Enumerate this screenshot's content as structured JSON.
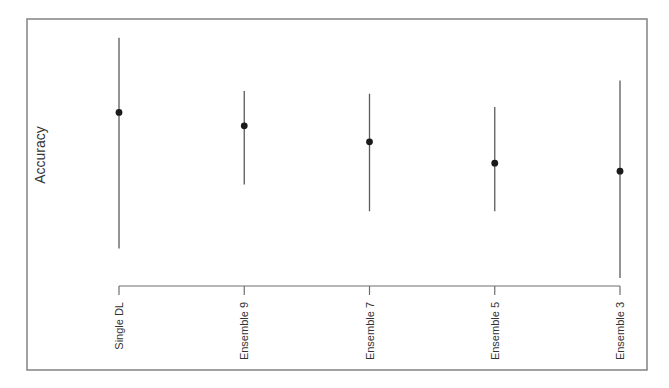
{
  "chart_data": {
    "type": "scatter",
    "subtype": "point-with-error-bars",
    "title": "",
    "xlabel": "",
    "ylabel": "Accuracy",
    "y_tick_labels_shown": false,
    "y_units": "relative (no tick values shown; 0 = x-axis baseline, 1 = top of frame)",
    "ylim": [
      0,
      1
    ],
    "grid": false,
    "legend": "none",
    "categories": [
      "Single DL",
      "Ensemble 9",
      "Ensemble 7",
      "Ensemble 5",
      "Ensemble 3"
    ],
    "series": [
      {
        "name": "Accuracy",
        "values": [
          0.65,
          0.6,
          0.54,
          0.46,
          0.43
        ],
        "upper": [
          0.93,
          0.73,
          0.72,
          0.67,
          0.77
        ],
        "lower": [
          0.14,
          0.38,
          0.28,
          0.28,
          0.03
        ]
      }
    ],
    "colors": {
      "point": "#1a1a1a",
      "error_bar": "#5a5a5a",
      "frame": "#8a8a8a",
      "axis": "#6e6e6e"
    }
  }
}
